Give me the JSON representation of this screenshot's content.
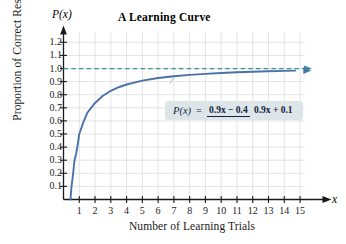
{
  "chart_data": {
    "type": "line",
    "title": "A Learning Curve",
    "xlabel": "Number of Learning Trials",
    "ylabel": "Proportion of Correct Responses",
    "x_axis_variable": "x",
    "y_axis_variable": "P(x)",
    "xlim": [
      0,
      15.8
    ],
    "ylim": [
      0,
      1.28
    ],
    "grid": true,
    "legend": "none",
    "equation": {
      "lhs": "P(x)",
      "equals": "=",
      "numerator": "0.9x − 0.4",
      "denominator": "0.9x + 0.1",
      "plain": "P(x) = (0.9x - 0.4) / (0.9x + 0.1)"
    },
    "xticks": [
      1,
      2,
      3,
      4,
      5,
      6,
      7,
      8,
      9,
      10,
      11,
      12,
      13,
      14,
      15
    ],
    "xtick_labels": [
      "1",
      "2",
      "3",
      "4",
      "5",
      "6",
      "7",
      "8",
      "9",
      "10",
      "11",
      "12",
      "13",
      "14",
      "15"
    ],
    "yticks": [
      0.1,
      0.2,
      0.3,
      0.4,
      0.5,
      0.6,
      0.7,
      0.8,
      0.9,
      1.0,
      1.1,
      1.2
    ],
    "ytick_labels": [
      "0.1",
      "0.2",
      "0.3",
      "0.4",
      "0.5",
      "0.6",
      "0.7",
      "0.8",
      "0.9",
      "1.0",
      "1.1",
      "1.2"
    ],
    "series": [
      {
        "name": "P(x) = (0.9x - 0.4)/(0.9x + 0.1)",
        "color": "#4a72a8",
        "style": "solid",
        "arrow_end": true,
        "x_intercept": 0.444,
        "x": [
          0.444,
          0.5,
          0.6,
          0.7,
          0.8,
          0.9,
          1.0,
          1.25,
          1.5,
          1.75,
          2.0,
          2.5,
          3.0,
          3.5,
          4.0,
          5.0,
          6.0,
          7.0,
          8.0,
          9.0,
          10.0,
          11.0,
          12.0,
          13.0,
          14.0,
          14.7
        ],
        "y": [
          0.0,
          0.091,
          0.188,
          0.3,
          0.348,
          0.418,
          0.5,
          0.587,
          0.66,
          0.699,
          0.737,
          0.792,
          0.83,
          0.857,
          0.878,
          0.907,
          0.927,
          0.941,
          0.951,
          0.959,
          0.966,
          0.971,
          0.975,
          0.979,
          0.982,
          0.984
        ]
      }
    ],
    "asymptote": {
      "name": "horizontal asymptote y = 1",
      "value": 1.0,
      "color": "#35968c",
      "style": "dashed",
      "arrow_end": true
    },
    "annotations": [
      {
        "name": "leader-line",
        "from": "formula-box",
        "to": "curve at x≈7"
      }
    ]
  }
}
